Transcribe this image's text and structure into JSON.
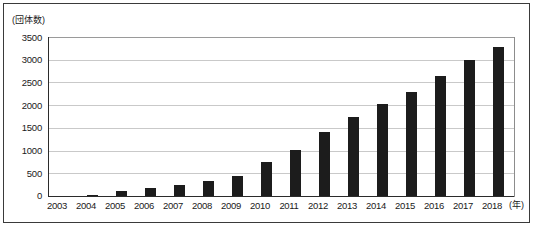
{
  "chart_data": {
    "type": "bar",
    "title": "",
    "xlabel": "(年)",
    "ylabel": "(団体数)",
    "categories": [
      "2003",
      "2004",
      "2005",
      "2006",
      "2007",
      "2008",
      "2009",
      "2010",
      "2011",
      "2012",
      "2013",
      "2014",
      "2015",
      "2016",
      "2017",
      "2018"
    ],
    "values": [
      0,
      30,
      110,
      170,
      250,
      340,
      440,
      760,
      1020,
      1400,
      1730,
      2030,
      2290,
      2650,
      3000,
      3270
    ],
    "ylim": [
      0,
      3500
    ],
    "yticks": [
      "0",
      "500",
      "1000",
      "1500",
      "2000",
      "2500",
      "3000",
      "3500"
    ],
    "ytick_values": [
      0,
      500,
      1000,
      1500,
      2000,
      2500,
      3000,
      3500
    ],
    "grid": true,
    "legend": "none",
    "bar_color": "#1c1c1c",
    "grid_color": "#c9c9c9",
    "axis_color": "#2b2b2b"
  },
  "frame": {
    "border_color": "#3a3a3a"
  },
  "caption": {
    "text": ""
  }
}
